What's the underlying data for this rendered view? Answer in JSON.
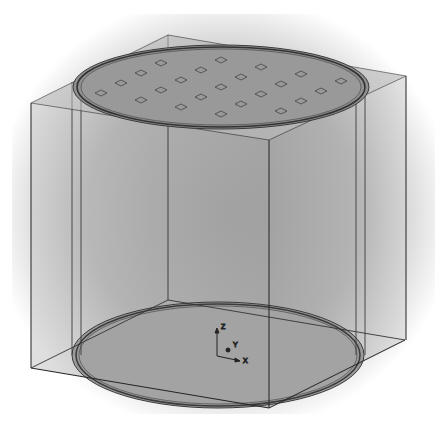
{
  "diagram": {
    "type": "3d-wireframe-model",
    "colors": {
      "background": "#ffffff",
      "vignette": "#c8c8c8",
      "box_fill": "#a8a8a8",
      "disc_fill": "#8f8f8f",
      "edge": "#2a2a2a",
      "ring": "#3a3a3a"
    },
    "axes": {
      "z": "Z",
      "y": "Y",
      "x": "X"
    },
    "patch_grid": {
      "rows": 6,
      "cols": 7
    }
  }
}
